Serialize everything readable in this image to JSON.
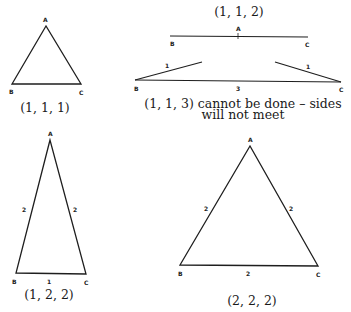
{
  "diagrams": {
    "t111": {
      "caption": "(1, 1, 1)",
      "vertices": {
        "A": "A",
        "B": "B",
        "C": "C"
      },
      "side_labels": []
    },
    "t112": {
      "caption": "(1, 1, 2)",
      "vertices": {
        "A": "A",
        "B": "B",
        "C": "C"
      },
      "side_labels": []
    },
    "t113": {
      "caption_line1": "(1, 1, 3) cannot be done – sides",
      "caption_line2": "will not meet",
      "vertices": {
        "B": "B",
        "C": "C"
      },
      "side_labels": {
        "left": "1",
        "right": "1",
        "base": "3"
      }
    },
    "t122": {
      "caption": "(1, 2, 2)",
      "vertices": {
        "A": "A",
        "B": "B",
        "C": "C"
      },
      "side_labels": {
        "left": "2",
        "right": "2",
        "base": "1"
      }
    },
    "t222": {
      "caption": "(2, 2, 2)",
      "vertices": {
        "A": "A",
        "B": "B",
        "C": "C"
      },
      "side_labels": {
        "left": "2",
        "right": "2",
        "base": "2"
      }
    }
  },
  "colors": {
    "line": "#1e1e1e",
    "text": "#1a1a1a",
    "background": "#ffffff"
  }
}
